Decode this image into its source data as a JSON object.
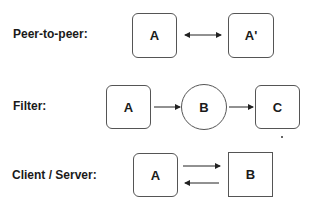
{
  "rows": [
    {
      "label": "Peer-to-peer:",
      "nodes": [
        {
          "id": "A",
          "text": "A",
          "shape": "rounded"
        },
        {
          "id": "A_prime",
          "text": "A'",
          "shape": "rounded"
        }
      ],
      "edges": [
        {
          "from": "A",
          "to": "A_prime",
          "type": "bidirectional"
        }
      ]
    },
    {
      "label": "Filter:",
      "nodes": [
        {
          "id": "A",
          "text": "A",
          "shape": "rounded"
        },
        {
          "id": "B",
          "text": "B",
          "shape": "circle"
        },
        {
          "id": "C",
          "text": "C",
          "shape": "rounded"
        }
      ],
      "edges": [
        {
          "from": "A",
          "to": "B",
          "type": "directed"
        },
        {
          "from": "B",
          "to": "C",
          "type": "directed"
        }
      ]
    },
    {
      "label": "Client / Server:",
      "nodes": [
        {
          "id": "A",
          "text": "A",
          "shape": "rounded"
        },
        {
          "id": "B",
          "text": "B",
          "shape": "square"
        }
      ],
      "edges": [
        {
          "from": "A",
          "to": "B",
          "type": "directed"
        },
        {
          "from": "B",
          "to": "A",
          "type": "directed"
        }
      ]
    }
  ]
}
